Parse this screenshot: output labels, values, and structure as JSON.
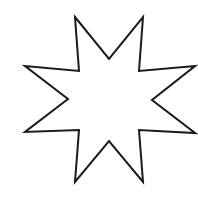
{
  "figure": {
    "shape": "eight-pointed-star",
    "fill": "#ffffff",
    "stroke": "#1a1a1a",
    "stroke_width": 2,
    "points": "75,17 109,59 143,17 139,71 195,66 152,100 195,133 139,130 143,182 109,141 75,182 79,130 25,132 68,99 25,66 79,71"
  }
}
